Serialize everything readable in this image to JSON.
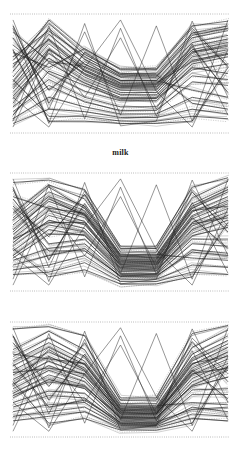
{
  "figure": {
    "label": "milk",
    "caption_label": "milk",
    "panel_count": 3,
    "background_color": "#ffffff",
    "line_color": "#232323",
    "reference_line_color": "#8a8a8a"
  },
  "chart_data": {
    "type": "line",
    "title": "milk",
    "subtitle": "",
    "xlabel": "",
    "ylabel": "",
    "plot_kind": "parallel-coordinates",
    "grid": false,
    "legend_position": "none",
    "axis_count": 7,
    "x": [
      0,
      1,
      2,
      3,
      4,
      5,
      6
    ],
    "xlim": [
      0,
      6
    ],
    "ylim": [
      0,
      1
    ],
    "annotations": [
      "milk"
    ],
    "panels": [
      {
        "name": "panel-1",
        "top_reference_line": true,
        "bottom_reference_line": true,
        "series": [
          {
            "name": "s1",
            "values": [
              0.52,
              0.88,
              0.62,
              0.47,
              0.47,
              0.8,
              0.86
            ]
          },
          {
            "name": "s2",
            "values": [
              0.47,
              0.83,
              0.58,
              0.44,
              0.44,
              0.76,
              0.82
            ]
          },
          {
            "name": "s3",
            "values": [
              0.43,
              0.79,
              0.55,
              0.41,
              0.41,
              0.73,
              0.79
            ]
          },
          {
            "name": "s4",
            "values": [
              0.4,
              0.75,
              0.52,
              0.39,
              0.39,
              0.7,
              0.76
            ]
          },
          {
            "name": "s5",
            "values": [
              0.37,
              0.71,
              0.49,
              0.36,
              0.36,
              0.67,
              0.73
            ]
          },
          {
            "name": "s6",
            "values": [
              0.34,
              0.67,
              0.47,
              0.34,
              0.34,
              0.64,
              0.7
            ]
          },
          {
            "name": "s7",
            "values": [
              0.31,
              0.63,
              0.44,
              0.32,
              0.32,
              0.61,
              0.67
            ]
          },
          {
            "name": "s8",
            "values": [
              0.29,
              0.59,
              0.42,
              0.3,
              0.3,
              0.58,
              0.64
            ]
          },
          {
            "name": "s9",
            "values": [
              0.61,
              0.92,
              0.66,
              0.5,
              0.5,
              0.84,
              0.9
            ]
          },
          {
            "name": "s10",
            "values": [
              0.68,
              0.55,
              0.71,
              0.53,
              0.53,
              0.88,
              0.56
            ]
          },
          {
            "name": "s11",
            "values": [
              0.74,
              0.5,
              0.35,
              0.27,
              0.27,
              0.55,
              0.5
            ]
          },
          {
            "name": "s12",
            "values": [
              0.22,
              0.45,
              0.3,
              0.22,
              0.22,
              0.48,
              0.45
            ]
          },
          {
            "name": "s13",
            "values": [
              0.18,
              0.4,
              0.26,
              0.19,
              0.19,
              0.43,
              0.4
            ]
          },
          {
            "name": "s14",
            "values": [
              0.8,
              0.36,
              0.6,
              0.44,
              0.44,
              0.36,
              0.3
            ]
          },
          {
            "name": "s15",
            "values": [
              0.12,
              0.3,
              0.22,
              0.16,
              0.16,
              0.3,
              0.25
            ]
          },
          {
            "name": "s16",
            "values": [
              0.9,
              0.25,
              0.68,
              0.49,
              0.49,
              0.25,
              0.2
            ]
          },
          {
            "name": "s17",
            "values": [
              0.08,
              0.2,
              0.18,
              0.13,
              0.13,
              0.2,
              0.16
            ]
          },
          {
            "name": "s18",
            "values": [
              0.55,
              0.95,
              0.7,
              0.54,
              0.54,
              0.9,
              0.94
            ]
          },
          {
            "name": "s19",
            "values": [
              0.64,
              0.86,
              0.64,
              0.48,
              0.48,
              0.82,
              0.88
            ]
          },
          {
            "name": "s20",
            "values": [
              0.45,
              0.14,
              0.14,
              0.1,
              0.1,
              0.14,
              0.12
            ]
          },
          {
            "name": "s21",
            "values": [
              0.7,
              0.1,
              0.1,
              0.08,
              0.08,
              0.1,
              0.55
            ]
          },
          {
            "name": "s22",
            "values": [
              0.25,
              0.7,
              0.5,
              0.38,
              0.38,
              0.68,
              0.74
            ]
          },
          {
            "name": "s23",
            "values": [
              0.85,
              0.6,
              0.56,
              0.42,
              0.42,
              0.6,
              0.66
            ]
          },
          {
            "name": "s24",
            "values": [
              0.15,
              0.52,
              0.4,
              0.29,
              0.29,
              0.53,
              0.58
            ]
          },
          {
            "name": "s25",
            "values": [
              0.58,
              0.78,
              0.53,
              0.4,
              0.4,
              0.72,
              0.34
            ]
          }
        ]
      },
      {
        "name": "panel-2",
        "top_reference_line": true,
        "bottom_reference_line": true,
        "series": [
          {
            "name": "t1",
            "values": [
              0.6,
              0.84,
              0.72,
              0.3,
              0.3,
              0.74,
              0.88
            ]
          },
          {
            "name": "t2",
            "values": [
              0.56,
              0.8,
              0.68,
              0.28,
              0.28,
              0.7,
              0.84
            ]
          },
          {
            "name": "t3",
            "values": [
              0.52,
              0.76,
              0.65,
              0.26,
              0.26,
              0.67,
              0.8
            ]
          },
          {
            "name": "t4",
            "values": [
              0.48,
              0.72,
              0.62,
              0.25,
              0.25,
              0.64,
              0.77
            ]
          },
          {
            "name": "t5",
            "values": [
              0.45,
              0.68,
              0.59,
              0.23,
              0.23,
              0.61,
              0.74
            ]
          },
          {
            "name": "t6",
            "values": [
              0.41,
              0.64,
              0.56,
              0.22,
              0.22,
              0.58,
              0.7
            ]
          },
          {
            "name": "t7",
            "values": [
              0.38,
              0.6,
              0.53,
              0.2,
              0.2,
              0.55,
              0.67
            ]
          },
          {
            "name": "t8",
            "values": [
              0.34,
              0.56,
              0.5,
              0.19,
              0.19,
              0.52,
              0.64
            ]
          },
          {
            "name": "t9",
            "values": [
              0.3,
              0.52,
              0.47,
              0.17,
              0.17,
              0.49,
              0.6
            ]
          },
          {
            "name": "t10",
            "values": [
              0.66,
              0.9,
              0.78,
              0.33,
              0.33,
              0.79,
              0.93
            ]
          },
          {
            "name": "t11",
            "values": [
              0.72,
              0.46,
              0.82,
              0.36,
              0.36,
              0.84,
              0.5
            ]
          },
          {
            "name": "t12",
            "values": [
              0.78,
              0.4,
              0.44,
              0.15,
              0.15,
              0.44,
              0.44
            ]
          },
          {
            "name": "t13",
            "values": [
              0.26,
              0.36,
              0.4,
              0.14,
              0.14,
              0.4,
              0.38
            ]
          },
          {
            "name": "t14",
            "values": [
              0.22,
              0.3,
              0.36,
              0.12,
              0.12,
              0.35,
              0.32
            ]
          },
          {
            "name": "t15",
            "values": [
              0.86,
              0.26,
              0.74,
              0.31,
              0.31,
              0.28,
              0.26
            ]
          },
          {
            "name": "t16",
            "values": [
              0.18,
              0.22,
              0.3,
              0.1,
              0.1,
              0.22,
              0.2
            ]
          },
          {
            "name": "t17",
            "values": [
              0.92,
              0.94,
              0.86,
              0.38,
              0.38,
              0.88,
              0.96
            ]
          },
          {
            "name": "t18",
            "values": [
              0.14,
              0.16,
              0.24,
              0.08,
              0.08,
              0.16,
              0.14
            ]
          },
          {
            "name": "t19",
            "values": [
              0.62,
              0.88,
              0.7,
              0.29,
              0.29,
              0.72,
              0.86
            ]
          },
          {
            "name": "t20",
            "values": [
              0.36,
              0.12,
              0.18,
              0.06,
              0.06,
              0.12,
              0.58
            ]
          },
          {
            "name": "t21",
            "values": [
              0.8,
              0.7,
              0.66,
              0.27,
              0.27,
              0.68,
              0.72
            ]
          },
          {
            "name": "t22",
            "values": [
              0.44,
              0.58,
              0.58,
              0.21,
              0.21,
              0.57,
              0.62
            ]
          },
          {
            "name": "t23",
            "values": [
              0.28,
              0.48,
              0.48,
              0.18,
              0.18,
              0.47,
              0.54
            ]
          },
          {
            "name": "t24",
            "values": [
              0.7,
              0.34,
              0.34,
              0.13,
              0.13,
              0.33,
              0.3
            ]
          },
          {
            "name": "t25",
            "values": [
              0.5,
              0.78,
              0.64,
              0.24,
              0.24,
              0.62,
              0.36
            ]
          }
        ]
      },
      {
        "name": "panel-3",
        "top_reference_line": true,
        "bottom_reference_line": true,
        "series": [
          {
            "name": "u1",
            "values": [
              0.7,
              0.86,
              0.7,
              0.26,
              0.26,
              0.72,
              0.88
            ]
          },
          {
            "name": "u2",
            "values": [
              0.66,
              0.82,
              0.66,
              0.25,
              0.25,
              0.69,
              0.84
            ]
          },
          {
            "name": "u3",
            "values": [
              0.62,
              0.78,
              0.63,
              0.23,
              0.23,
              0.66,
              0.81
            ]
          },
          {
            "name": "u4",
            "values": [
              0.58,
              0.74,
              0.6,
              0.22,
              0.22,
              0.63,
              0.78
            ]
          },
          {
            "name": "u5",
            "values": [
              0.54,
              0.7,
              0.57,
              0.2,
              0.2,
              0.6,
              0.74
            ]
          },
          {
            "name": "u6",
            "values": [
              0.5,
              0.66,
              0.54,
              0.19,
              0.19,
              0.57,
              0.71
            ]
          },
          {
            "name": "u7",
            "values": [
              0.46,
              0.62,
              0.51,
              0.18,
              0.18,
              0.54,
              0.68
            ]
          },
          {
            "name": "u8",
            "values": [
              0.42,
              0.58,
              0.48,
              0.16,
              0.16,
              0.51,
              0.64
            ]
          },
          {
            "name": "u9",
            "values": [
              0.38,
              0.54,
              0.45,
              0.15,
              0.15,
              0.48,
              0.61
            ]
          },
          {
            "name": "u10",
            "values": [
              0.34,
              0.5,
              0.42,
              0.14,
              0.14,
              0.45,
              0.58
            ]
          },
          {
            "name": "u11",
            "values": [
              0.76,
              0.92,
              0.76,
              0.29,
              0.29,
              0.78,
              0.93
            ]
          },
          {
            "name": "u12",
            "values": [
              0.82,
              0.44,
              0.82,
              0.32,
              0.32,
              0.83,
              0.48
            ]
          },
          {
            "name": "u13",
            "values": [
              0.3,
              0.4,
              0.38,
              0.12,
              0.12,
              0.41,
              0.42
            ]
          },
          {
            "name": "u14",
            "values": [
              0.26,
              0.36,
              0.34,
              0.11,
              0.11,
              0.37,
              0.37
            ]
          },
          {
            "name": "u15",
            "values": [
              0.88,
              0.32,
              0.72,
              0.27,
              0.27,
              0.3,
              0.28
            ]
          },
          {
            "name": "u16",
            "values": [
              0.22,
              0.28,
              0.3,
              0.1,
              0.1,
              0.26,
              0.22
            ]
          },
          {
            "name": "u17",
            "values": [
              0.18,
              0.22,
              0.26,
              0.09,
              0.09,
              0.2,
              0.18
            ]
          },
          {
            "name": "u18",
            "values": [
              0.94,
              0.96,
              0.88,
              0.34,
              0.34,
              0.9,
              0.97
            ]
          },
          {
            "name": "u19",
            "values": [
              0.14,
              0.18,
              0.22,
              0.08,
              0.08,
              0.16,
              0.14
            ]
          },
          {
            "name": "u20",
            "values": [
              0.48,
              0.12,
              0.16,
              0.06,
              0.06,
              0.12,
              0.62
            ]
          },
          {
            "name": "u21",
            "values": [
              0.72,
              0.68,
              0.64,
              0.24,
              0.24,
              0.64,
              0.7
            ]
          },
          {
            "name": "u22",
            "values": [
              0.56,
              0.6,
              0.55,
              0.21,
              0.21,
              0.55,
              0.6
            ]
          },
          {
            "name": "u23",
            "values": [
              0.36,
              0.48,
              0.44,
              0.17,
              0.17,
              0.44,
              0.52
            ]
          },
          {
            "name": "u24",
            "values": [
              0.64,
              0.26,
              0.32,
              0.13,
              0.13,
              0.24,
              0.26
            ]
          },
          {
            "name": "u25",
            "values": [
              0.44,
              0.76,
              0.58,
              0.2,
              0.2,
              0.58,
              0.33
            ]
          }
        ]
      }
    ]
  }
}
